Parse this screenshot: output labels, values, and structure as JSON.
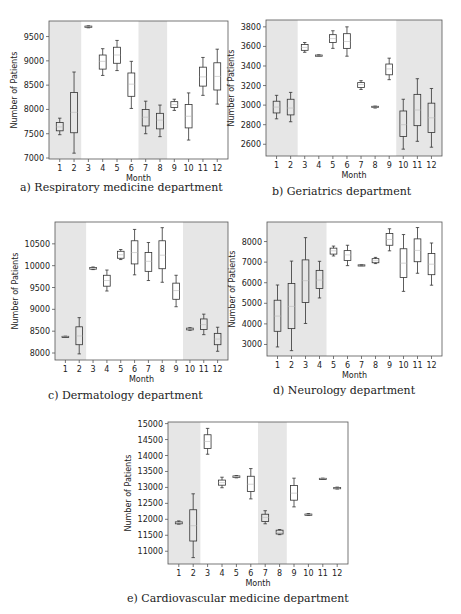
{
  "chart_data": [
    {
      "id": "a",
      "type": "boxplot",
      "title": "a) Respiratory medicine department",
      "xlabel": "Month",
      "ylabel": "Number of Patients",
      "categories": [
        "1",
        "2",
        "3",
        "4",
        "5",
        "6",
        "7",
        "8",
        "9",
        "10",
        "11",
        "12"
      ],
      "yticks": [
        7000,
        7500,
        8000,
        8500,
        9000,
        9500
      ],
      "ylim": [
        6980,
        9820
      ],
      "shaded_months": [
        [
          1,
          2
        ],
        [
          7,
          8
        ]
      ],
      "boxes": [
        {
          "month": 1,
          "whislo": 7480,
          "q1": 7560,
          "med": 7640,
          "q3": 7730,
          "whishi": 7820
        },
        {
          "month": 2,
          "whislo": 7100,
          "q1": 7520,
          "med": 7940,
          "q3": 8350,
          "whishi": 8770
        },
        {
          "month": 3,
          "whislo": 9680,
          "q1": 9690,
          "med": 9700,
          "q3": 9715,
          "whishi": 9720
        },
        {
          "month": 4,
          "whislo": 8700,
          "q1": 8830,
          "med": 8990,
          "q3": 9120,
          "whishi": 9250
        },
        {
          "month": 5,
          "whislo": 8800,
          "q1": 8950,
          "med": 9120,
          "q3": 9280,
          "whishi": 9420
        },
        {
          "month": 6,
          "whislo": 8020,
          "q1": 8270,
          "med": 8520,
          "q3": 8750,
          "whishi": 8990
        },
        {
          "month": 7,
          "whislo": 7500,
          "q1": 7660,
          "med": 7840,
          "q3": 8000,
          "whishi": 8170
        },
        {
          "month": 8,
          "whislo": 7440,
          "q1": 7600,
          "med": 7780,
          "q3": 7920,
          "whishi": 8090
        },
        {
          "month": 9,
          "whislo": 7980,
          "q1": 8040,
          "med": 8100,
          "q3": 8160,
          "whishi": 8210
        },
        {
          "month": 10,
          "whislo": 7370,
          "q1": 7620,
          "med": 7860,
          "q3": 8100,
          "whishi": 8340
        },
        {
          "month": 11,
          "whislo": 8290,
          "q1": 8480,
          "med": 8670,
          "q3": 8870,
          "whishi": 9070
        },
        {
          "month": 12,
          "whislo": 8110,
          "q1": 8400,
          "med": 8680,
          "q3": 8960,
          "whishi": 9240
        }
      ],
      "layout": {
        "left": 49,
        "top": 21,
        "width": 179,
        "height": 138,
        "caption_x": 20,
        "caption_y": 181
      }
    },
    {
      "id": "b",
      "type": "boxplot",
      "title": "b) Geriatrics department",
      "xlabel": "Month",
      "ylabel": "Number of Patients",
      "categories": [
        "1",
        "2",
        "3",
        "4",
        "5",
        "6",
        "7",
        "8",
        "9",
        "10",
        "11",
        "12"
      ],
      "yticks": [
        2600,
        2800,
        3000,
        3200,
        3400,
        3600,
        3800
      ],
      "ylim": [
        2480,
        3870
      ],
      "shaded_months": [
        [
          1,
          2
        ],
        [
          10,
          12
        ]
      ],
      "boxes": [
        {
          "month": 1,
          "whislo": 2860,
          "q1": 2920,
          "med": 2980,
          "q3": 3040,
          "whishi": 3100
        },
        {
          "month": 2,
          "whislo": 2830,
          "q1": 2900,
          "med": 2970,
          "q3": 3060,
          "whishi": 3130
        },
        {
          "month": 3,
          "whislo": 3540,
          "q1": 3560,
          "med": 3590,
          "q3": 3620,
          "whishi": 3640
        },
        {
          "month": 4,
          "whislo": 3505,
          "q1": 3508,
          "med": 3510,
          "q3": 3512,
          "whishi": 3515
        },
        {
          "month": 5,
          "whislo": 3580,
          "q1": 3640,
          "med": 3680,
          "q3": 3720,
          "whishi": 3760
        },
        {
          "month": 6,
          "whislo": 3500,
          "q1": 3580,
          "med": 3650,
          "q3": 3730,
          "whishi": 3800
        },
        {
          "month": 7,
          "whislo": 3160,
          "q1": 3180,
          "med": 3210,
          "q3": 3230,
          "whishi": 3250
        },
        {
          "month": 8,
          "whislo": 2970,
          "q1": 2975,
          "med": 2980,
          "q3": 2988,
          "whishi": 2990
        },
        {
          "month": 9,
          "whislo": 3260,
          "q1": 3310,
          "med": 3370,
          "q3": 3420,
          "whishi": 3480
        },
        {
          "month": 10,
          "whislo": 2550,
          "q1": 2680,
          "med": 2800,
          "q3": 2940,
          "whishi": 3060
        },
        {
          "month": 11,
          "whislo": 2630,
          "q1": 2790,
          "med": 2950,
          "q3": 3110,
          "whishi": 3270
        },
        {
          "month": 12,
          "whislo": 2570,
          "q1": 2720,
          "med": 2870,
          "q3": 3020,
          "whishi": 3170
        }
      ],
      "layout": {
        "left": 266,
        "top": 20,
        "width": 176,
        "height": 136,
        "caption_x": 272,
        "caption_y": 185
      }
    },
    {
      "id": "c",
      "type": "boxplot",
      "title": "c) Dermatology department",
      "xlabel": "Month",
      "ylabel": "Number of Patients",
      "categories": [
        "1",
        "2",
        "3",
        "4",
        "5",
        "6",
        "7",
        "8",
        "9",
        "10",
        "11",
        "12"
      ],
      "yticks": [
        8000,
        8500,
        9000,
        9500,
        10000,
        10500
      ],
      "ylim": [
        7840,
        11000
      ],
      "shaded_months": [
        [
          1,
          2
        ],
        [
          10,
          12
        ]
      ],
      "boxes": [
        {
          "month": 1,
          "whislo": 8375,
          "q1": 8378,
          "med": 8380,
          "q3": 8382,
          "whishi": 8385
        },
        {
          "month": 2,
          "whislo": 7980,
          "q1": 8190,
          "med": 8390,
          "q3": 8600,
          "whishi": 8810
        },
        {
          "month": 3,
          "whislo": 9910,
          "q1": 9920,
          "med": 9940,
          "q3": 9960,
          "whishi": 9970
        },
        {
          "month": 4,
          "whislo": 9420,
          "q1": 9530,
          "med": 9660,
          "q3": 9780,
          "whishi": 9900
        },
        {
          "month": 5,
          "whislo": 10140,
          "q1": 10170,
          "med": 10250,
          "q3": 10330,
          "whishi": 10370
        },
        {
          "month": 6,
          "whislo": 9790,
          "q1": 10040,
          "med": 10300,
          "q3": 10570,
          "whishi": 10830
        },
        {
          "month": 7,
          "whislo": 9660,
          "q1": 9870,
          "med": 10100,
          "q3": 10300,
          "whishi": 10530
        },
        {
          "month": 8,
          "whislo": 9620,
          "q1": 9930,
          "med": 10240,
          "q3": 10570,
          "whishi": 10870
        },
        {
          "month": 9,
          "whislo": 9060,
          "q1": 9230,
          "med": 9430,
          "q3": 9600,
          "whishi": 9780
        },
        {
          "month": 10,
          "whislo": 8520,
          "q1": 8530,
          "med": 8550,
          "q3": 8570,
          "whishi": 8580
        },
        {
          "month": 11,
          "whislo": 8420,
          "q1": 8540,
          "med": 8650,
          "q3": 8780,
          "whishi": 8890
        },
        {
          "month": 12,
          "whislo": 8040,
          "q1": 8190,
          "med": 8320,
          "q3": 8450,
          "whishi": 8590
        }
      ],
      "layout": {
        "left": 55,
        "top": 222,
        "width": 173,
        "height": 138,
        "caption_x": 48,
        "caption_y": 389
      }
    },
    {
      "id": "d",
      "type": "boxplot",
      "title": "d) Neurology department",
      "xlabel": "Month",
      "ylabel": "Number of Patients",
      "categories": [
        "1",
        "2",
        "3",
        "4",
        "5",
        "6",
        "7",
        "8",
        "9",
        "10",
        "11",
        "12"
      ],
      "yticks": [
        3000,
        4000,
        5000,
        6000,
        7000,
        8000
      ],
      "ylim": [
        2440,
        8950
      ],
      "shaded_months": [
        [
          1,
          4
        ]
      ],
      "boxes": [
        {
          "month": 1,
          "whislo": 2880,
          "q1": 3640,
          "med": 4380,
          "q3": 5150,
          "whishi": 5890
        },
        {
          "month": 2,
          "whislo": 2700,
          "q1": 3770,
          "med": 4850,
          "q3": 5960,
          "whishi": 7050
        },
        {
          "month": 3,
          "whislo": 4020,
          "q1": 5040,
          "med": 6100,
          "q3": 7110,
          "whishi": 8190
        },
        {
          "month": 4,
          "whislo": 5260,
          "q1": 5720,
          "med": 6130,
          "q3": 6600,
          "whishi": 7040
        },
        {
          "month": 5,
          "whislo": 7300,
          "q1": 7390,
          "med": 7550,
          "q3": 7680,
          "whishi": 7780
        },
        {
          "month": 6,
          "whislo": 6830,
          "q1": 7080,
          "med": 7350,
          "q3": 7560,
          "whishi": 7820
        },
        {
          "month": 7,
          "whislo": 6830,
          "q1": 6845,
          "med": 6860,
          "q3": 6870,
          "whishi": 6880
        },
        {
          "month": 8,
          "whislo": 6930,
          "q1": 6970,
          "med": 7070,
          "q3": 7170,
          "whishi": 7230
        },
        {
          "month": 9,
          "whislo": 7550,
          "q1": 7820,
          "med": 8100,
          "q3": 8390,
          "whishi": 8620
        },
        {
          "month": 10,
          "whislo": 5580,
          "q1": 6250,
          "med": 6950,
          "q3": 7650,
          "whishi": 8340
        },
        {
          "month": 11,
          "whislo": 6460,
          "q1": 7020,
          "med": 7570,
          "q3": 8130,
          "whishi": 8680
        },
        {
          "month": 12,
          "whislo": 5880,
          "q1": 6390,
          "med": 6900,
          "q3": 7420,
          "whishi": 7930
        }
      ],
      "layout": {
        "left": 267,
        "top": 222,
        "width": 175,
        "height": 134,
        "caption_x": 273,
        "caption_y": 384
      }
    },
    {
      "id": "e",
      "type": "boxplot",
      "title": "e) Cardiovascular medicine department",
      "xlabel": "Month",
      "ylabel": "Number of Patients",
      "categories": [
        "1",
        "2",
        "3",
        "4",
        "5",
        "6",
        "7",
        "8",
        "9",
        "10",
        "11",
        "12"
      ],
      "yticks": [
        11000,
        11500,
        12000,
        12500,
        13000,
        13500,
        14000,
        14500,
        15000
      ],
      "ylim": [
        10600,
        15050
      ],
      "shaded_months": [
        [
          1,
          2
        ],
        [
          7,
          8
        ]
      ],
      "boxes": [
        {
          "month": 1,
          "whislo": 11850,
          "q1": 11860,
          "med": 11890,
          "q3": 11920,
          "whishi": 11950
        },
        {
          "month": 2,
          "whislo": 10800,
          "q1": 11320,
          "med": 11800,
          "q3": 12300,
          "whishi": 12800
        },
        {
          "month": 3,
          "whislo": 14040,
          "q1": 14220,
          "med": 14440,
          "q3": 14650,
          "whishi": 14850
        },
        {
          "month": 4,
          "whislo": 12990,
          "q1": 13070,
          "med": 13150,
          "q3": 13230,
          "whishi": 13320
        },
        {
          "month": 5,
          "whislo": 13300,
          "q1": 13310,
          "med": 13330,
          "q3": 13360,
          "whishi": 13370
        },
        {
          "month": 6,
          "whislo": 12640,
          "q1": 12870,
          "med": 13100,
          "q3": 13350,
          "whishi": 13590
        },
        {
          "month": 7,
          "whislo": 11860,
          "q1": 11930,
          "med": 12060,
          "q3": 12160,
          "whishi": 12270
        },
        {
          "month": 8,
          "whislo": 11520,
          "q1": 11540,
          "med": 11590,
          "q3": 11660,
          "whishi": 11680
        },
        {
          "month": 9,
          "whislo": 12390,
          "q1": 12600,
          "med": 12820,
          "q3": 13060,
          "whishi": 13290
        },
        {
          "month": 10,
          "whislo": 12130,
          "q1": 12140,
          "med": 12150,
          "q3": 12165,
          "whishi": 12180
        },
        {
          "month": 11,
          "whislo": 13270,
          "q1": 13275,
          "med": 13280,
          "q3": 13285,
          "whishi": 13290
        },
        {
          "month": 12,
          "whislo": 12950,
          "q1": 12965,
          "med": 12980,
          "q3": 12995,
          "whishi": 13010
        }
      ],
      "layout": {
        "left": 168,
        "top": 422,
        "width": 180,
        "height": 142,
        "caption_x": 127,
        "caption_y": 592
      }
    }
  ],
  "style": {
    "shade_color": "#e6e6e6",
    "box_color": "#333333",
    "median_color": "#bbbbbb",
    "axis_color": "#555555"
  }
}
